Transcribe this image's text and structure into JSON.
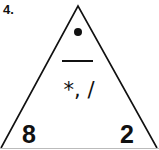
{
  "problem": {
    "number_label": "4.",
    "triangle": {
      "top_symbol": "dot",
      "divider": "fraction-bar",
      "operations": "*, /",
      "bottom_left": "8",
      "bottom_right": "2"
    }
  }
}
